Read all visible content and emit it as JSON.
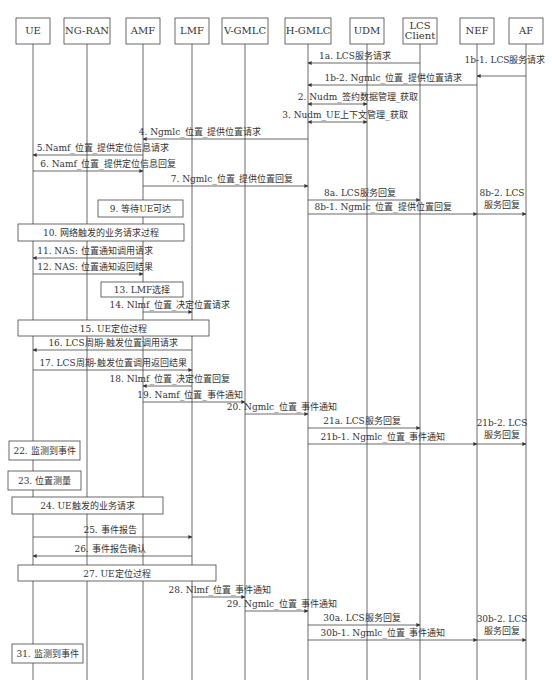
{
  "participants": [
    {
      "id": "UE",
      "label": [
        "UE"
      ],
      "x": 33
    },
    {
      "id": "NG-RAN",
      "label": [
        "NG-RAN"
      ],
      "x": 87
    },
    {
      "id": "AMF",
      "label": [
        "AMF"
      ],
      "x": 143
    },
    {
      "id": "LMF",
      "label": [
        "LMF"
      ],
      "x": 192
    },
    {
      "id": "V-GMLC",
      "label": [
        "V-GMLC"
      ],
      "x": 245
    },
    {
      "id": "H-GMLC",
      "label": [
        "H-GMLC"
      ],
      "x": 308
    },
    {
      "id": "UDM",
      "label": [
        "UDM"
      ],
      "x": 367
    },
    {
      "id": "LCS Client",
      "label": [
        "LCS",
        "Client"
      ],
      "x": 420
    },
    {
      "id": "NEF",
      "label": [
        "NEF"
      ],
      "x": 477
    },
    {
      "id": "AF",
      "label": [
        "AF"
      ],
      "x": 526
    }
  ],
  "lifeline_end_y": 680,
  "messages": [
    {
      "label": "1a. LCS服务请求",
      "from": "LCS Client",
      "to": "H-GMLC",
      "y": 63,
      "lx": 355
    },
    {
      "label": "1b-1. LCS服务请求",
      "from": "AF",
      "to": "NEF",
      "y": 76,
      "lx": 505,
      "lly": 63
    },
    {
      "label": "1b-2. Ngmlc_位置_提供位置请求",
      "from": "NEF",
      "to": "H-GMLC",
      "y": 85,
      "lx": 393
    },
    {
      "label": "2. Nudm_签约数据管理_获取",
      "from": "H-GMLC",
      "to": "UDM",
      "y": 104,
      "lx": 358,
      "bidir": true
    },
    {
      "label": "3. Nudm_UE上下文管理_获取",
      "from": "H-GMLC",
      "to": "UDM",
      "y": 122,
      "lx": 345,
      "bidir": true
    },
    {
      "label": "4. Ngmlc_位置_提供位置请求",
      "from": "H-GMLC",
      "to": "AMF",
      "y": 139,
      "lx": 200
    },
    {
      "label": "5.Namf_位置_提供定位信息请求",
      "from": "AMF",
      "to": "UE",
      "y": 155,
      "lx": 103
    },
    {
      "label": "6. Namf_位置_提供定位信息回复",
      "from": "UE",
      "to": "AMF",
      "y": 171,
      "lx": 108
    },
    {
      "label": "7. Ngmlc_位置_提供位置回复",
      "from": "AMF",
      "to": "H-GMLC",
      "y": 186,
      "lx": 232
    },
    {
      "label": "8a. LCS服务回复",
      "from": "H-GMLC",
      "to": "LCS Client",
      "y": 200,
      "lx": 360
    },
    {
      "label": "8b-1. Ngmlc_位置_提供位置回复",
      "from": "H-GMLC",
      "to": "NEF",
      "y": 214,
      "lx": 383
    },
    {
      "label": "",
      "from": "NEF",
      "to": "AF",
      "y": 214,
      "lx": 0
    },
    {
      "label": "11. NAS: 位置通知调用请求",
      "from": "AMF",
      "to": "UE",
      "y": 258,
      "lx": 95
    },
    {
      "label": "12. NAS: 位置通知返回结果",
      "from": "UE",
      "to": "AMF",
      "y": 274,
      "lx": 95
    },
    {
      "label": "14. Nlmf_位置_决定位置请求",
      "from": "AMF",
      "to": "LMF",
      "y": 312,
      "lx": 170
    },
    {
      "label": "16. LCS周期-触发位置调用请求",
      "from": "LMF",
      "to": "UE",
      "y": 350,
      "lx": 113
    },
    {
      "label": "17. LCS周期-触发位置调用返回结果",
      "from": "UE",
      "to": "LMF",
      "y": 370,
      "lx": 113
    },
    {
      "label": "18. Nlmf_位置_决定位置回复",
      "from": "LMF",
      "to": "AMF",
      "y": 386,
      "lx": 170
    },
    {
      "label": "19. Namf_位置_事件通知",
      "from": "AMF",
      "to": "V-GMLC",
      "y": 402,
      "lx": 190
    },
    {
      "label": "20. Ngmlc_位置_事件通知",
      "from": "V-GMLC",
      "to": "H-GMLC",
      "y": 414,
      "lx": 282
    },
    {
      "label": "21a. LCS服务回复",
      "from": "H-GMLC",
      "to": "LCS Client",
      "y": 428,
      "lx": 362
    },
    {
      "label": "21b-1. Ngmlc_位置_事件通知",
      "from": "H-GMLC",
      "to": "NEF",
      "y": 444,
      "lx": 383
    },
    {
      "label": "",
      "from": "NEF",
      "to": "AF",
      "y": 444,
      "lx": 0
    },
    {
      "label": "25. 事件报告",
      "from": "UE",
      "to": "LMF",
      "y": 537,
      "lx": 110
    },
    {
      "label": "26. 事件报告确认",
      "from": "LMF",
      "to": "UE",
      "y": 556,
      "lx": 110
    },
    {
      "label": "28. Nlmf_位置_事件通知",
      "from": "LMF",
      "to": "V-GMLC",
      "y": 597,
      "lx": 220
    },
    {
      "label": "29. Ngmlc_位置_事件通知",
      "from": "V-GMLC",
      "to": "H-GMLC",
      "y": 611,
      "lx": 282
    },
    {
      "label": "30a. LCS服务回复",
      "from": "H-GMLC",
      "to": "LCS Client",
      "y": 625,
      "lx": 362
    },
    {
      "label": "30b-1. Ngmlc_位置_事件通知",
      "from": "H-GMLC",
      "to": "NEF",
      "y": 640,
      "lx": 383
    },
    {
      "label": "",
      "from": "NEF",
      "to": "AF",
      "y": 640,
      "lx": 0
    }
  ],
  "side_notes": [
    {
      "lines": [
        "8b-2. LCS",
        "服务回复"
      ],
      "x": 502,
      "y": 196
    },
    {
      "lines": [
        "21b-2. LCS",
        "服务回复"
      ],
      "x": 502,
      "y": 426
    },
    {
      "lines": [
        "30b-2. LCS",
        "服务回复"
      ],
      "x": 502,
      "y": 622
    }
  ],
  "boxes": [
    {
      "label": "9. 等待UE可达",
      "x": 98,
      "y": 200,
      "w": 85,
      "h": 17
    },
    {
      "label": "10. 网络触发的业务请求过程",
      "x": 18,
      "y": 224,
      "w": 166,
      "h": 17
    },
    {
      "label": "13. LMF选择",
      "x": 101,
      "y": 282,
      "w": 82,
      "h": 15
    },
    {
      "label": "15. UE定位过程",
      "x": 18,
      "y": 320,
      "w": 191,
      "h": 16
    },
    {
      "label": "22. 监测到事件",
      "x": 9,
      "y": 441,
      "w": 71,
      "h": 19
    },
    {
      "label": "23. 位置测量",
      "x": 8,
      "y": 471,
      "w": 73,
      "h": 19
    },
    {
      "label": "24. UE触发的业务请求",
      "x": 12,
      "y": 497,
      "w": 151,
      "h": 17
    },
    {
      "label": "27. UE定位过程",
      "x": 18,
      "y": 565,
      "w": 198,
      "h": 16
    },
    {
      "label": "31. 监测到事件",
      "x": 12,
      "y": 644,
      "w": 71,
      "h": 19
    }
  ],
  "colors": {
    "line": "#444444",
    "text": "#333333",
    "background": "#ffffff"
  }
}
